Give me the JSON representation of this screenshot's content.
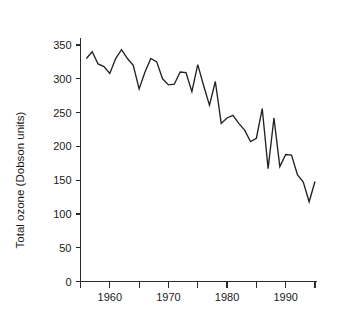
{
  "chart_data": {
    "type": "line",
    "title": "",
    "xlabel": "",
    "ylabel": "Total ozone (Dobson units)",
    "xlim": [
      1955,
      1995
    ],
    "ylim": [
      0,
      370
    ],
    "grid": false,
    "legend": "none",
    "y_ticks": [
      0,
      50,
      100,
      150,
      200,
      250,
      300,
      350
    ],
    "y_tick_labels": [
      "0",
      "50",
      "100",
      "150",
      "200",
      "250",
      "300",
      "350"
    ],
    "x_major_ticks": [
      1960,
      1970,
      1980,
      1990
    ],
    "x_major_tick_labels": [
      "1960",
      "1970",
      "1980",
      "1990"
    ],
    "x_minor_ticks": [
      1955,
      1965,
      1975,
      1985,
      1995
    ],
    "series": [
      {
        "name": "Total ozone",
        "color": "#222222",
        "x": [
          1956,
          1957,
          1958,
          1959,
          1960,
          1961,
          1962,
          1963,
          1964,
          1965,
          1966,
          1967,
          1968,
          1969,
          1970,
          1971,
          1972,
          1973,
          1974,
          1975,
          1976,
          1977,
          1978,
          1979,
          1980,
          1981,
          1982,
          1983,
          1984,
          1985,
          1986,
          1987,
          1988,
          1989,
          1990,
          1991,
          1992,
          1993,
          1994,
          1995
        ],
        "values": [
          330,
          340,
          322,
          318,
          308,
          330,
          343,
          330,
          320,
          285,
          310,
          330,
          325,
          300,
          291,
          292,
          310,
          309,
          281,
          321,
          290,
          261,
          296,
          234,
          242,
          246,
          234,
          224,
          207,
          212,
          256,
          167,
          242,
          170,
          188,
          187,
          158,
          147,
          118,
          148
        ]
      }
    ]
  },
  "axis_titles": {
    "y": "Total ozone (Dobson units)"
  }
}
